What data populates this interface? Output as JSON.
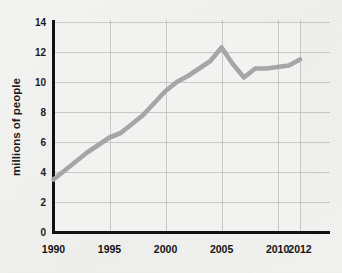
{
  "chart_data": {
    "type": "line",
    "title": "",
    "subtitle": "",
    "xlabel": "",
    "ylabel": "millions of people",
    "xlim": [
      1990,
      2012
    ],
    "ylim": [
      0,
      14
    ],
    "grid": true,
    "legend": false,
    "legend_position": "none",
    "line_color": "#a6a6a6",
    "axis_color": "#101010",
    "grid_color": "#b5b5b3",
    "background_color": "#f1f1ef",
    "y_ticks": [
      "0",
      "2",
      "4",
      "6",
      "8",
      "10",
      "12",
      "14"
    ],
    "y_tick_values": [
      0,
      2,
      4,
      6,
      8,
      10,
      12,
      14
    ],
    "x_ticks": [
      "1990",
      "1995",
      "2000",
      "2005",
      "2010",
      "2012"
    ],
    "x_tick_values": [
      1990,
      1995,
      2000,
      2005,
      2010,
      2012
    ],
    "x_gridline_values": [
      1990,
      1995,
      2000,
      2005,
      2010,
      2012
    ],
    "x": [
      1990,
      1991,
      1992,
      1993,
      1994,
      1995,
      1996,
      1997,
      1998,
      1999,
      2000,
      2001,
      2002,
      2003,
      2004,
      2005,
      2006,
      2007,
      2008,
      2009,
      2010,
      2011,
      2012
    ],
    "values": [
      3.5,
      4.1,
      4.7,
      5.3,
      5.8,
      6.3,
      6.6,
      7.2,
      7.8,
      8.6,
      9.4,
      10.0,
      10.4,
      10.9,
      11.4,
      12.3,
      11.2,
      10.3,
      10.9,
      10.9,
      11.0,
      11.1,
      11.5
    ],
    "series": [
      {
        "name": "millions of people",
        "color": "#a6a6a6",
        "values": [
          3.5,
          4.1,
          4.7,
          5.3,
          5.8,
          6.3,
          6.6,
          7.2,
          7.8,
          8.6,
          9.4,
          10.0,
          10.4,
          10.9,
          11.4,
          12.3,
          11.2,
          10.3,
          10.9,
          10.9,
          11.0,
          11.1,
          11.5
        ]
      }
    ],
    "annotations": []
  }
}
